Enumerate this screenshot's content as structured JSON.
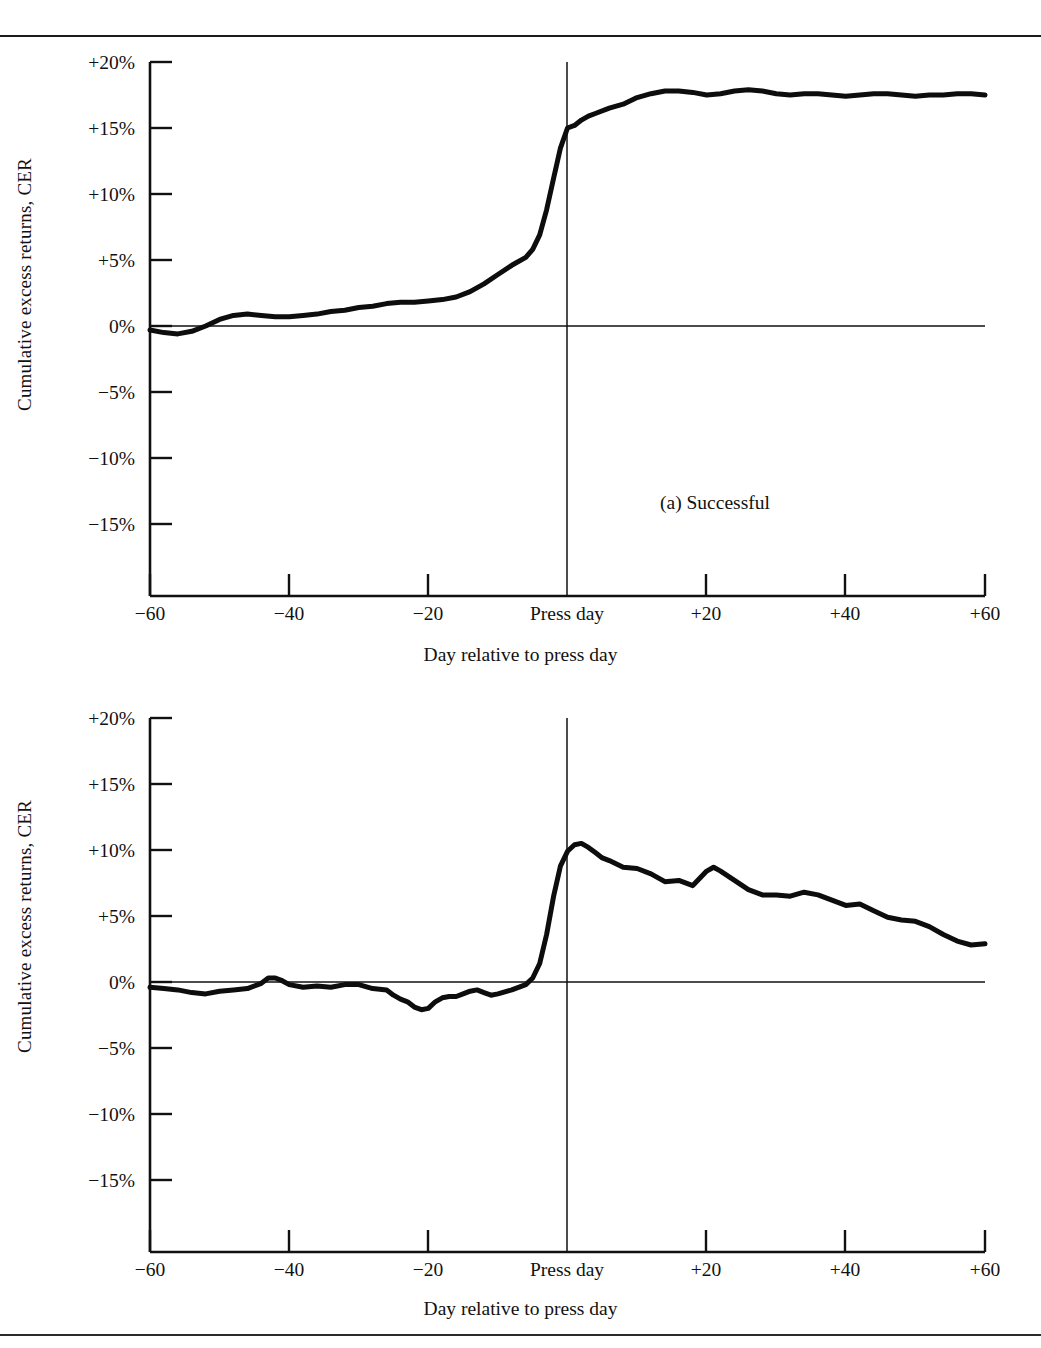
{
  "figure": {
    "background": "#ffffff",
    "ink_color": "#111111",
    "rules": {
      "top": true,
      "bottom": true
    }
  },
  "panels": [
    {
      "id": "a",
      "panel_label": "(a)  Successful",
      "ylabel": "Cumulative excess returns, CER",
      "xlabel": "Day relative to press day",
      "ytick_labels": [
        "+20%",
        "+15%",
        "+10%",
        "+5%",
        "0%",
        "−5%",
        "−10%",
        "−15%"
      ],
      "xtick_labels": [
        "−60",
        "−40",
        "−20",
        "Press day",
        "+20",
        "+40",
        "+60"
      ]
    },
    {
      "id": "b",
      "panel_label": "(b)  Unsuccessful",
      "ylabel": "Cumulative excess returns, CER",
      "xlabel": "Day relative to press day",
      "ytick_labels": [
        "+20%",
        "+15%",
        "+10%",
        "+5%",
        "0%",
        "−5%",
        "−10%",
        "−15%"
      ],
      "xtick_labels": [
        "−60",
        "−40",
        "−20",
        "Press day",
        "+20",
        "+40",
        "+60"
      ]
    }
  ],
  "chart_data": [
    {
      "type": "line",
      "id": "panel-a",
      "title": "(a)  Successful",
      "xlabel": "Day relative to press day",
      "ylabel": "Cumulative excess returns, CER",
      "xlim": [
        -60,
        60
      ],
      "ylim": [
        -17.5,
        20
      ],
      "yticks": [
        20,
        15,
        10,
        5,
        0,
        -5,
        -10,
        -15
      ],
      "ytick_labels": [
        "+20%",
        "+15%",
        "+10%",
        "+5%",
        "0%",
        "−5%",
        "−10%",
        "−15%"
      ],
      "xticks": [
        -60,
        -40,
        -20,
        0,
        20,
        40,
        60
      ],
      "xtick_labels": [
        "−60",
        "−40",
        "−20",
        "Press day",
        "+20",
        "+40",
        "+60"
      ],
      "grid": false,
      "legend": null,
      "annotations": [
        {
          "text": "(a)  Successful",
          "x": 20,
          "y": -11.0
        },
        {
          "type": "vline",
          "x": 0,
          "label": "press day"
        },
        {
          "type": "hline",
          "y": 0
        }
      ],
      "series": [
        {
          "name": "Successful takeovers CER",
          "units": "percent",
          "x": [
            -60,
            -58,
            -56,
            -54,
            -52,
            -50,
            -48,
            -46,
            -44,
            -42,
            -40,
            -38,
            -36,
            -34,
            -32,
            -30,
            -28,
            -26,
            -24,
            -22,
            -20,
            -18,
            -16,
            -14,
            -12,
            -10,
            -8,
            -6,
            -5,
            -4,
            -3,
            -2,
            -1,
            0,
            1,
            2,
            3,
            4,
            6,
            8,
            10,
            12,
            14,
            16,
            18,
            20,
            22,
            24,
            26,
            28,
            30,
            32,
            34,
            36,
            38,
            40,
            42,
            44,
            46,
            48,
            50,
            52,
            54,
            56,
            58,
            60
          ],
          "values": [
            -0.3,
            -0.5,
            -0.6,
            -0.4,
            0.0,
            0.5,
            0.8,
            0.9,
            0.8,
            0.7,
            0.7,
            0.8,
            0.9,
            1.1,
            1.2,
            1.4,
            1.5,
            1.7,
            1.8,
            1.8,
            1.9,
            2.0,
            2.2,
            2.6,
            3.2,
            3.9,
            4.6,
            5.2,
            5.8,
            6.9,
            8.8,
            11.2,
            13.5,
            15.0,
            15.2,
            15.6,
            15.9,
            16.1,
            16.5,
            16.8,
            17.3,
            17.6,
            17.8,
            17.8,
            17.7,
            17.5,
            17.6,
            17.8,
            17.9,
            17.8,
            17.6,
            17.5,
            17.6,
            17.6,
            17.5,
            17.4,
            17.5,
            17.6,
            17.6,
            17.5,
            17.4,
            17.5,
            17.5,
            17.6,
            17.6,
            17.5,
            17.6
          ]
        }
      ]
    },
    {
      "type": "line",
      "id": "panel-b",
      "title": "(b)  Unsuccessful",
      "xlabel": "Day relative to press day",
      "ylabel": "Cumulative excess returns, CER",
      "xlim": [
        -60,
        60
      ],
      "ylim": [
        -17.5,
        20
      ],
      "yticks": [
        20,
        15,
        10,
        5,
        0,
        -5,
        -10,
        -15
      ],
      "ytick_labels": [
        "+20%",
        "+15%",
        "+10%",
        "+5%",
        "0%",
        "−5%",
        "−10%",
        "−15%"
      ],
      "xticks": [
        -60,
        -40,
        -20,
        0,
        20,
        40,
        60
      ],
      "xtick_labels": [
        "−60",
        "−40",
        "−20",
        "Press day",
        "+20",
        "+40",
        "+60"
      ],
      "grid": false,
      "legend": null,
      "annotations": [
        {
          "text": "(b)  Unsuccessful",
          "x": 20,
          "y": -11.5
        },
        {
          "type": "vline",
          "x": 0,
          "label": "press day"
        },
        {
          "type": "hline",
          "y": 0
        }
      ],
      "series": [
        {
          "name": "Unsuccessful takeovers CER",
          "units": "percent",
          "x": [
            -60,
            -58,
            -56,
            -54,
            -52,
            -50,
            -48,
            -46,
            -44,
            -43,
            -42,
            -41,
            -40,
            -38,
            -36,
            -34,
            -32,
            -30,
            -28,
            -26,
            -25,
            -24,
            -23,
            -22,
            -21,
            -20,
            -19,
            -18,
            -17,
            -16,
            -15,
            -14,
            -13,
            -12,
            -11,
            -10,
            -8,
            -6,
            -5,
            -4,
            -3,
            -2,
            -1,
            0,
            1,
            2,
            3,
            4,
            5,
            6,
            8,
            10,
            12,
            14,
            16,
            18,
            20,
            21,
            22,
            24,
            26,
            28,
            30,
            32,
            34,
            36,
            38,
            40,
            42,
            44,
            46,
            48,
            50,
            52,
            54,
            56,
            58,
            60
          ],
          "values": [
            -0.4,
            -0.5,
            -0.6,
            -0.8,
            -0.9,
            -0.7,
            -0.6,
            -0.5,
            -0.1,
            0.3,
            0.3,
            0.1,
            -0.2,
            -0.4,
            -0.3,
            -0.4,
            -0.2,
            -0.2,
            -0.5,
            -0.6,
            -1.0,
            -1.3,
            -1.5,
            -1.9,
            -2.1,
            -2.0,
            -1.5,
            -1.2,
            -1.1,
            -1.1,
            -0.9,
            -0.7,
            -0.6,
            -0.8,
            -1.0,
            -0.9,
            -0.6,
            -0.2,
            0.3,
            1.4,
            3.6,
            6.5,
            8.8,
            9.9,
            10.4,
            10.5,
            10.2,
            9.8,
            9.4,
            9.2,
            8.7,
            8.6,
            8.2,
            7.6,
            7.7,
            7.3,
            8.4,
            8.7,
            8.4,
            7.7,
            7.0,
            6.6,
            6.6,
            6.5,
            6.8,
            6.6,
            6.2,
            5.8,
            5.9,
            5.4,
            4.9,
            4.7,
            4.6,
            4.2,
            3.6,
            3.1,
            2.8,
            2.9,
            2.7,
            1.6
          ]
        }
      ]
    }
  ]
}
